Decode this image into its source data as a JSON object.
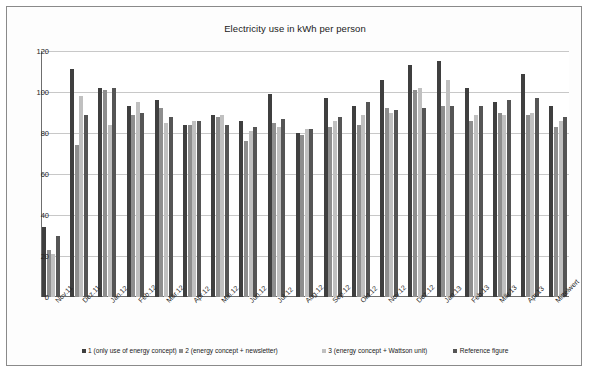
{
  "chart_data": {
    "type": "bar",
    "title": "Electricity use in kWh per person",
    "xlabel": "",
    "ylabel": "",
    "ylim": [
      0,
      120
    ],
    "yticks": [
      0,
      20,
      40,
      60,
      80,
      100,
      120
    ],
    "grid": true,
    "legend_position": "bottom",
    "categories": [
      "Nov.11",
      "Dez.11",
      "Jan.12",
      "Feb.12",
      "Mär.12",
      "Apr.12",
      "Mai.12",
      "Jun.12",
      "Jul.12",
      "Aug.12",
      "Sep.12",
      "Okt.12",
      "Nov.12",
      "Dez.12",
      "Jan.13",
      "Feb.13",
      "Mär.13",
      "Apr.13",
      "Mittelwert"
    ],
    "series": [
      {
        "name": "1 (only use of energy concept)",
        "color": "#3f3f3f",
        "values": [
          34,
          111,
          102,
          93,
          96,
          84,
          89,
          86,
          99,
          80,
          97,
          93,
          106,
          113,
          115,
          102,
          95,
          109,
          93
        ]
      },
      {
        "name": "2 (energy concept + newsletter)",
        "color": "#8e8e8e",
        "values": [
          23,
          74,
          101,
          89,
          92,
          84,
          88,
          76,
          85,
          79,
          83,
          84,
          92,
          101,
          93,
          86,
          90,
          89,
          83
        ]
      },
      {
        "name": "3 (energy concept + Wattson unit)",
        "color": "#c0c0c0",
        "values": [
          21,
          98,
          84,
          95,
          85,
          86,
          89,
          81,
          83,
          82,
          86,
          89,
          90,
          102,
          106,
          89,
          89,
          90,
          86
        ]
      },
      {
        "name": "Reference figure",
        "color": "#555555",
        "values": [
          30,
          89,
          102,
          90,
          88,
          86,
          84,
          83,
          87,
          82,
          88,
          95,
          91,
          92,
          93,
          93,
          96,
          97,
          88
        ]
      }
    ]
  },
  "legend": {
    "items": [
      {
        "label": "1 (only use of energy concept)",
        "swatch": "sw0"
      },
      {
        "label": "2 (energy concept + newsletter)",
        "swatch": "sw1"
      },
      {
        "label": "3 (energy concept + Wattson unit)",
        "swatch": "sw2"
      },
      {
        "label": "Reference figure",
        "swatch": "sw3"
      }
    ]
  }
}
